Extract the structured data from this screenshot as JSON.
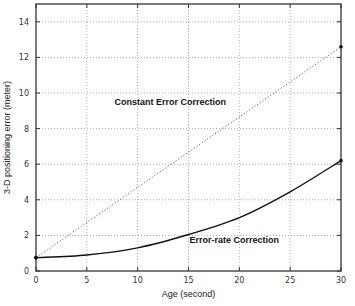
{
  "chart_data": {
    "type": "line",
    "title": "",
    "xlabel": "Age (second)",
    "ylabel": "3-D positioning error (meter)",
    "xlim": [
      0,
      30
    ],
    "ylim": [
      0,
      15
    ],
    "xticks": [
      0,
      5,
      10,
      15,
      20,
      25,
      30
    ],
    "yticks": [
      0,
      2,
      4,
      6,
      8,
      10,
      12,
      14
    ],
    "xtick_labels": [
      "0",
      "5",
      "10",
      "15",
      "20",
      "25",
      "30"
    ],
    "ytick_labels": [
      "0",
      "2",
      "4",
      "6",
      "8",
      "10",
      "12",
      "14"
    ],
    "grid": true,
    "series": [
      {
        "name": "Constant Error Correction",
        "style": "dotted",
        "x": [
          0,
          30
        ],
        "y": [
          0.75,
          12.6
        ]
      },
      {
        "name": "Error-rate Correction",
        "style": "solid",
        "x": [
          0,
          5,
          10,
          15,
          20,
          25,
          30
        ],
        "y": [
          0.75,
          0.9,
          1.3,
          2.05,
          3.0,
          4.45,
          6.2
        ]
      }
    ],
    "annotations": [
      {
        "text": "Constant Error Correction",
        "x": 13.2,
        "y": 9.3
      },
      {
        "text": "Error-rate Correction",
        "x": 19.5,
        "y": 1.6
      }
    ]
  }
}
